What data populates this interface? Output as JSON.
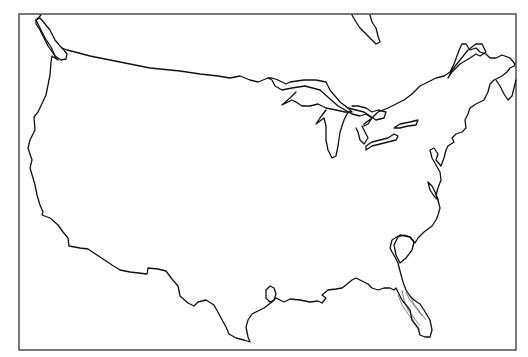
{
  "map": {
    "type": "blank-outline-map",
    "region": "Contiguous United States",
    "labels": [],
    "colors": {
      "background": "#ffffff",
      "outline": "#111111",
      "frame": "#333333"
    }
  }
}
